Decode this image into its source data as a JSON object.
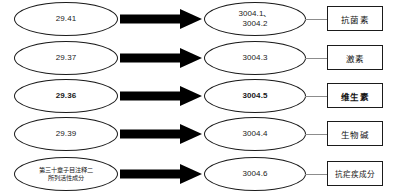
{
  "diagram": {
    "type": "flow-mapping",
    "direction": "left-to-right",
    "arrow_color": "#000000",
    "outline_color": "#1b1b1b",
    "connector_color": "#8c8c8c",
    "rows": [
      {
        "source": {
          "text": "29.41",
          "lines": [
            "29.41"
          ],
          "bold": false,
          "cjk": false
        },
        "arrow": "thick-black-right-arrow",
        "target": {
          "text": "3004.1、3004.2",
          "lines": [
            "3004.1、",
            "3004.2"
          ],
          "bold": false
        },
        "label": {
          "text": "抗菌素",
          "bold": false
        }
      },
      {
        "source": {
          "text": "29.37",
          "lines": [
            "29.37"
          ],
          "bold": false,
          "cjk": false
        },
        "arrow": "thick-black-right-arrow",
        "target": {
          "text": "3004.3",
          "lines": [
            "3004.3"
          ],
          "bold": false
        },
        "label": {
          "text": "激素",
          "bold": false
        }
      },
      {
        "source": {
          "text": "29.36",
          "lines": [
            "29.36"
          ],
          "bold": true,
          "cjk": false
        },
        "arrow": "thick-black-right-arrow",
        "target": {
          "text": "3004.5",
          "lines": [
            "3004.5"
          ],
          "bold": true
        },
        "label": {
          "text": "维生素",
          "bold": true
        }
      },
      {
        "source": {
          "text": "29.39",
          "lines": [
            "29.39"
          ],
          "bold": false,
          "cjk": false
        },
        "arrow": "thick-black-right-arrow",
        "target": {
          "text": "3004.4",
          "lines": [
            "3004.4"
          ],
          "bold": false
        },
        "label": {
          "text": "生物碱",
          "bold": false
        }
      },
      {
        "source": {
          "text": "第三十章子目注释二所列活性成分",
          "lines": [
            "第三十章子目注释二",
            "所列活性成分"
          ],
          "bold": false,
          "cjk": true
        },
        "arrow": "thick-black-right-arrow",
        "target": {
          "text": "3004.6",
          "lines": [
            "3004.6"
          ],
          "bold": false
        },
        "label": {
          "text": "抗疟疾成分",
          "bold": false
        }
      }
    ]
  }
}
